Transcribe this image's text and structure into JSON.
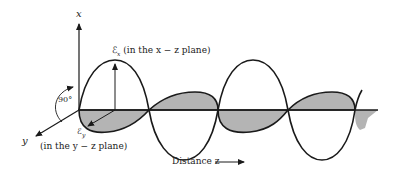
{
  "diagram": {
    "type": "electromagnetic-wave-polarization",
    "axes": {
      "x_label": "x",
      "y_label": "y",
      "z_label": "Distance z"
    },
    "angle_label": "90°",
    "field_x": {
      "symbol": "ℰ",
      "subscript": "x",
      "plane_text": "(in the x − z plane)"
    },
    "field_y": {
      "symbol": "ℰ",
      "subscript": "y",
      "plane_text": "(in the y − z plane)"
    },
    "colors": {
      "line": "#1a1a1a",
      "shade": "#b4b4b4",
      "background": "#ffffff"
    }
  }
}
